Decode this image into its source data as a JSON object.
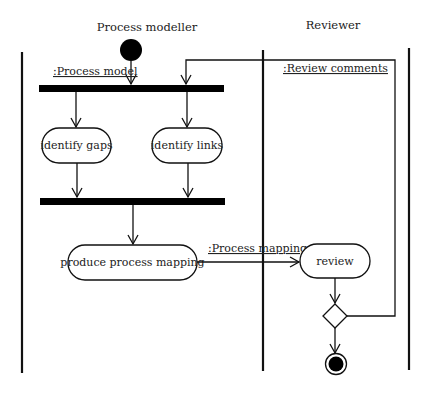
{
  "diagram": {
    "type": "UML activity diagram",
    "swimlanes": [
      {
        "id": "modeller",
        "label": "Process modeller"
      },
      {
        "id": "reviewer",
        "label": "Reviewer"
      }
    ],
    "objects": {
      "process_model": ":Process model",
      "review_comments": ":Review comments",
      "process_mapping": ":Process mapping"
    },
    "activities": {
      "identify_gaps": "identify gaps",
      "identify_links": "identify links",
      "produce_mapping": "produce process mapping",
      "review": "review"
    },
    "nodes": [
      "initial",
      "fork",
      "join",
      "decision",
      "final"
    ],
    "colors": {
      "stroke": "#111111",
      "fill": "#ffffff",
      "text": "#222222"
    }
  }
}
